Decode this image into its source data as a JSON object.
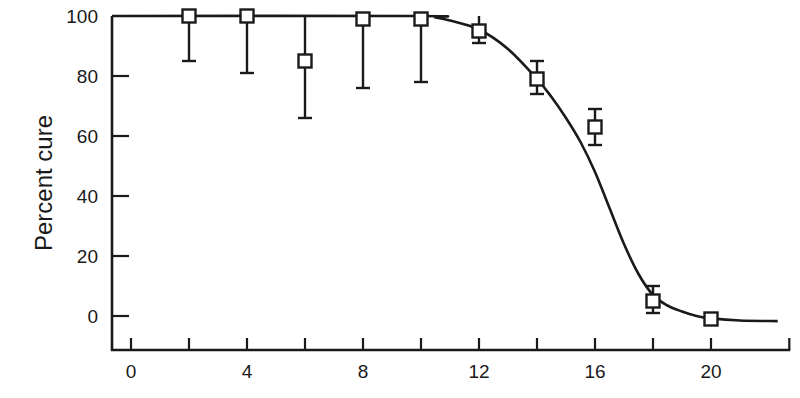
{
  "chart_data": {
    "type": "scatter",
    "title": "",
    "xlabel": "",
    "ylabel": "Percent cure",
    "xlim": [
      -0.65,
      22.7
    ],
    "ylim": [
      -11,
      100
    ],
    "x_ticks": [
      0,
      2,
      4,
      6,
      8,
      10,
      12,
      14,
      16,
      18,
      20,
      22.7
    ],
    "x_tick_labels": [
      {
        "value": 0,
        "label": "0"
      },
      {
        "value": 4,
        "label": "4"
      },
      {
        "value": 8,
        "label": "8"
      },
      {
        "value": 12,
        "label": "12"
      },
      {
        "value": 16,
        "label": "16"
      },
      {
        "value": 20,
        "label": "20"
      }
    ],
    "y_ticks": [
      0,
      20,
      40,
      60,
      80,
      100
    ],
    "y_tick_labels": [
      {
        "value": 0,
        "label": "0"
      },
      {
        "value": 20,
        "label": "20"
      },
      {
        "value": 40,
        "label": "40"
      },
      {
        "value": 60,
        "label": "60"
      },
      {
        "value": 80,
        "label": "80"
      },
      {
        "value": 100,
        "label": "100"
      }
    ],
    "grid": false,
    "legend": null,
    "series": [
      {
        "name": "Observed",
        "marker": "open-square",
        "points": [
          {
            "x": 2,
            "y": 100,
            "err_low": 85,
            "err_high": 100
          },
          {
            "x": 4,
            "y": 100,
            "err_low": 81,
            "err_high": 100
          },
          {
            "x": 6,
            "y": 85,
            "err_low": 66,
            "err_high": 100
          },
          {
            "x": 8,
            "y": 99,
            "err_low": 76,
            "err_high": 100
          },
          {
            "x": 10,
            "y": 99,
            "err_low": 78,
            "err_high": 100
          },
          {
            "x": 12,
            "y": 95,
            "err_low": 91,
            "err_high": 100
          },
          {
            "x": 14,
            "y": 79,
            "err_low": 74,
            "err_high": 85
          },
          {
            "x": 16,
            "y": 63,
            "err_low": 57,
            "err_high": 69
          },
          {
            "x": 18,
            "y": 5,
            "err_low": 1,
            "err_high": 10
          },
          {
            "x": 20,
            "y": -1,
            "err_low": -1,
            "err_high": -1
          }
        ]
      },
      {
        "name": "Fitted curve",
        "type": "line",
        "points": [
          [
            -0.65,
            100
          ],
          [
            10,
            100
          ],
          [
            10.5,
            99.5
          ],
          [
            11,
            98.5
          ],
          [
            12,
            95.5
          ],
          [
            13,
            89
          ],
          [
            14,
            79
          ],
          [
            14.5,
            73
          ],
          [
            15,
            66
          ],
          [
            15.5,
            58
          ],
          [
            16,
            48
          ],
          [
            16.5,
            36
          ],
          [
            17,
            24
          ],
          [
            17.5,
            14
          ],
          [
            18,
            7
          ],
          [
            18.5,
            3.5
          ],
          [
            19,
            1.5
          ],
          [
            19.5,
            0
          ],
          [
            20,
            -0.8
          ],
          [
            21,
            -1.5
          ],
          [
            22.3,
            -1.7
          ]
        ]
      }
    ]
  }
}
